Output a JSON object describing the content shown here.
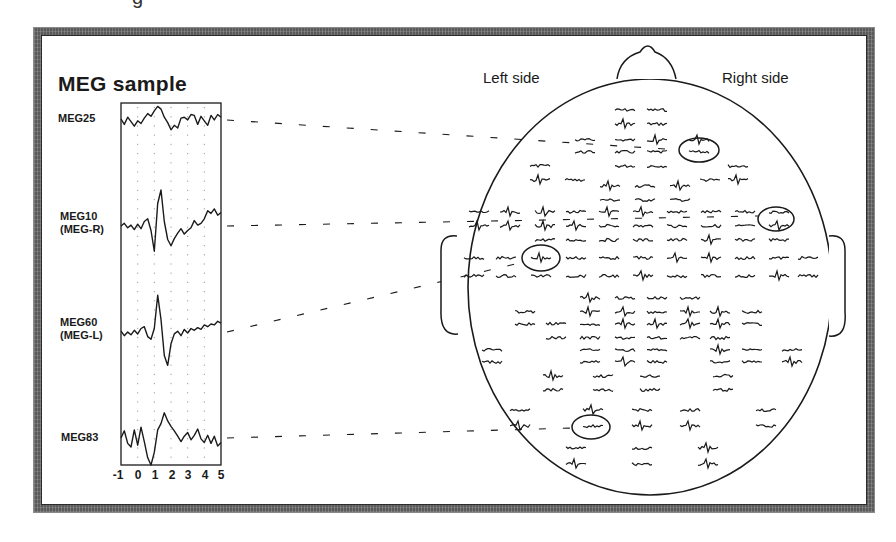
{
  "figure": {
    "partial_top_glyph": "g",
    "sample_panel": {
      "title": "MEG sample",
      "x_ticks": [
        "-1",
        "0",
        "1",
        "2",
        "3",
        "4",
        "5"
      ],
      "channels": [
        {
          "label": "MEG25",
          "sublabel": "",
          "baseline_y": 119
        },
        {
          "label": "MEG10",
          "sublabel": "(MEG-R)",
          "baseline_y": 226
        },
        {
          "label": "MEG60",
          "sublabel": "(MEG-L)",
          "baseline_y": 333
        },
        {
          "label": "MEG83",
          "sublabel": "",
          "baseline_y": 438
        }
      ]
    },
    "head_map": {
      "left_label": "Left side",
      "right_label": "Right side",
      "highlighted_sensors": [
        "MEG25",
        "MEG10 (MEG-R)",
        "MEG60 (MEG-L)",
        "MEG83"
      ]
    }
  },
  "chart_data": {
    "type": "line",
    "title": "MEG sample",
    "xlabel": "",
    "ylabel": "",
    "x_ticks": [
      -1,
      0,
      1,
      2,
      3,
      4,
      5
    ],
    "xlim": [
      -1,
      5
    ],
    "grid": "vertical dotted at integer ticks",
    "series": [
      {
        "name": "MEG25",
        "description": "noisy baseline, small bump near t=1.5",
        "x": [
          -1,
          -0.8,
          -0.6,
          -0.4,
          -0.2,
          0,
          0.2,
          0.4,
          0.6,
          0.8,
          1.0,
          1.2,
          1.4,
          1.6,
          1.8,
          2.0,
          2.2,
          2.4,
          2.6,
          2.8,
          3.0,
          3.2,
          3.4,
          3.6,
          3.8,
          4.0,
          4.2,
          4.4,
          4.6,
          4.8,
          5.0
        ],
        "y": [
          0,
          -0.6,
          0.2,
          -0.3,
          -0.8,
          -0.2,
          -0.5,
          0.1,
          0.6,
          0.3,
          0.9,
          1.4,
          1.1,
          0.2,
          -0.4,
          -1.2,
          -0.7,
          -1.0,
          0.1,
          0.2,
          -0.1,
          0.5,
          0.4,
          -0.6,
          0.3,
          -0.2,
          -0.7,
          0.4,
          -0.1,
          0.5,
          0.2
        ]
      },
      {
        "name": "MEG10 (MEG-R)",
        "description": "evoked response: dip at t≈1.0, sharp peak at t≈1.3, trough at t≈2.0",
        "x": [
          -1,
          -0.8,
          -0.6,
          -0.4,
          -0.2,
          0,
          0.2,
          0.4,
          0.6,
          0.8,
          1.0,
          1.2,
          1.4,
          1.6,
          1.8,
          2.0,
          2.2,
          2.4,
          2.6,
          2.8,
          3.0,
          3.2,
          3.4,
          3.6,
          3.8,
          4.0,
          4.2,
          4.4,
          4.6,
          4.8,
          5.0
        ],
        "y": [
          0,
          0.3,
          -0.2,
          0.1,
          -0.4,
          0.2,
          -0.3,
          0.5,
          0.8,
          -0.5,
          -2.8,
          2.5,
          4.0,
          0.5,
          -1.5,
          -2.2,
          -1.4,
          -0.8,
          -0.3,
          -0.9,
          -0.5,
          -0.2,
          0.6,
          0.1,
          0.3,
          0.8,
          1.7,
          1.4,
          1.9,
          1.2,
          1.5
        ]
      },
      {
        "name": "MEG60 (MEG-L)",
        "description": "evoked response: sharp peak at t≈1.2, deep trough at t≈1.8",
        "x": [
          -1,
          -0.8,
          -0.6,
          -0.4,
          -0.2,
          0,
          0.2,
          0.4,
          0.6,
          0.8,
          1.0,
          1.2,
          1.4,
          1.6,
          1.8,
          2.0,
          2.2,
          2.4,
          2.6,
          2.8,
          3.0,
          3.2,
          3.4,
          3.6,
          3.8,
          4.0,
          4.2,
          4.4,
          4.6,
          4.8,
          5.0
        ],
        "y": [
          0.2,
          -0.3,
          0.1,
          -0.2,
          0.3,
          -0.1,
          0.5,
          0.7,
          -0.4,
          -0.7,
          0.5,
          4.2,
          1.5,
          -2.5,
          -3.6,
          -1.2,
          -0.1,
          0.2,
          -0.3,
          0.4,
          0.0,
          0.5,
          0.3,
          0.6,
          0.4,
          0.9,
          0.7,
          1.0,
          0.9,
          1.3,
          1.1
        ]
      },
      {
        "name": "MEG83",
        "description": "noisy, dip near t=1.1, peak near t=1.8",
        "x": [
          -1,
          -0.8,
          -0.6,
          -0.4,
          -0.2,
          0,
          0.2,
          0.4,
          0.6,
          0.8,
          1.0,
          1.2,
          1.4,
          1.6,
          1.8,
          2.0,
          2.2,
          2.4,
          2.6,
          2.8,
          3.0,
          3.2,
          3.4,
          3.6,
          3.8,
          4.0,
          4.2,
          4.4,
          4.6,
          4.8,
          5.0
        ],
        "y": [
          0,
          0.8,
          -0.6,
          -1.0,
          0.9,
          -0.8,
          1.2,
          -0.4,
          -2.2,
          -3.0,
          -1.6,
          0.9,
          1.6,
          2.8,
          1.9,
          1.3,
          0.8,
          0.2,
          -0.4,
          0.2,
          0.6,
          -0.2,
          0.3,
          1.0,
          -0.1,
          -0.5,
          0.3,
          -0.6,
          0.2,
          -0.9,
          -0.5
        ]
      }
    ]
  },
  "layout": {
    "plot_box": {
      "x": 121,
      "y": 103,
      "w": 100,
      "h": 362
    },
    "head": {
      "cx": 650,
      "cy": 287,
      "rx": 182,
      "ry": 208
    },
    "nose": "M 617 79 Q 620 58 640 52 Q 648 40 655 52 Q 672 58 676 79",
    "left_ear": "M 457 236 Q 441 234 441 250 L 441 310 Q 440 336 458 334",
    "right_ear": "M 829 236 Q 845 234 845 250 L 845 312 Q 847 338 829 336",
    "sensor_rows": [
      {
        "y": 110,
        "xs": [
          625,
          657
        ]
      },
      {
        "y": 124,
        "xs": [
          625,
          657
        ]
      },
      {
        "y": 140,
        "xs": [
          585,
          625,
          657,
          699
        ]
      },
      {
        "y": 152,
        "xs": [
          585,
          625,
          657,
          699
        ]
      },
      {
        "y": 166,
        "xs": [
          540,
          625,
          657,
          738
        ]
      },
      {
        "y": 180,
        "xs": [
          540,
          575,
          710,
          738
        ]
      },
      {
        "y": 186,
        "xs": [
          610,
          645,
          680
        ]
      },
      {
        "y": 200,
        "xs": [
          610,
          645,
          680
        ]
      },
      {
        "y": 212,
        "xs": [
          479,
          510,
          545,
          576,
          609,
          643,
          677,
          711,
          745,
          779
        ]
      },
      {
        "y": 226,
        "xs": [
          479,
          510,
          545,
          576,
          609,
          643,
          677,
          711,
          745,
          779
        ]
      },
      {
        "y": 240,
        "xs": [
          545,
          576,
          609,
          643,
          677,
          711,
          745,
          779
        ]
      },
      {
        "y": 258,
        "xs": [
          474,
          506,
          541,
          576,
          609,
          643,
          677,
          711,
          745,
          779,
          808
        ]
      },
      {
        "y": 276,
        "xs": [
          474,
          506,
          541,
          576,
          609,
          643,
          677,
          711,
          745,
          779,
          808
        ]
      },
      {
        "y": 298,
        "xs": [
          590,
          625,
          657,
          690
        ]
      },
      {
        "y": 312,
        "xs": [
          525,
          590,
          625,
          657,
          690,
          720,
          752
        ]
      },
      {
        "y": 324,
        "xs": [
          525,
          556,
          590,
          625,
          657,
          690,
          720,
          752
        ]
      },
      {
        "y": 338,
        "xs": [
          556,
          590,
          625,
          657,
          690,
          720
        ]
      },
      {
        "y": 350,
        "xs": [
          492,
          590,
          625,
          657,
          720,
          752,
          792
        ]
      },
      {
        "y": 362,
        "xs": [
          492,
          590,
          625,
          657,
          720,
          752,
          792
        ]
      },
      {
        "y": 376,
        "xs": [
          553,
          603,
          650,
          723
        ]
      },
      {
        "y": 390,
        "xs": [
          553,
          603,
          650,
          723
        ]
      },
      {
        "y": 410,
        "xs": [
          520,
          593,
          642,
          690,
          766
        ]
      },
      {
        "y": 426,
        "xs": [
          520,
          593,
          642,
          690,
          766
        ]
      },
      {
        "y": 448,
        "xs": [
          576,
          642,
          708
        ]
      },
      {
        "y": 464,
        "xs": [
          576,
          642,
          708
        ]
      }
    ],
    "circles": [
      {
        "cx": 699,
        "cy": 150,
        "rx": 20,
        "ry": 12
      },
      {
        "cx": 776,
        "cy": 219,
        "rx": 18,
        "ry": 12
      },
      {
        "cx": 541,
        "cy": 258,
        "rx": 19,
        "ry": 13
      },
      {
        "cx": 591,
        "cy": 427,
        "rx": 19,
        "ry": 12
      }
    ],
    "connectors": [
      {
        "x1": 227,
        "y1": 120,
        "x2": 680,
        "y2": 150
      },
      {
        "x1": 227,
        "y1": 226,
        "x2": 758,
        "y2": 216
      },
      {
        "x1": 227,
        "y1": 332,
        "x2": 524,
        "y2": 262
      },
      {
        "x1": 227,
        "y1": 438,
        "x2": 573,
        "y2": 428
      }
    ]
  },
  "colors": {
    "ink": "#1a1a1a",
    "frame": "#5a5a5a",
    "grid": "#9a9a9a",
    "background": "#ffffff"
  }
}
